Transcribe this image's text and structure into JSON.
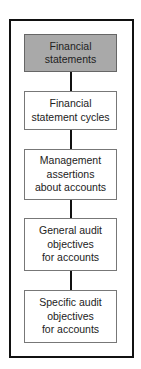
{
  "diagram": {
    "nodes": [
      {
        "label": "Financial statements",
        "lines": [
          "Financial",
          "statements"
        ],
        "highlighted": true
      },
      {
        "label": "Financial statement cycles",
        "lines": [
          "Financial",
          "statement cycles"
        ]
      },
      {
        "label": "Management assertions about accounts",
        "lines": [
          "Management",
          "assertions",
          "about accounts"
        ]
      },
      {
        "label": "General audit objectives for accounts",
        "lines": [
          "General audit",
          "objectives",
          "for accounts"
        ]
      },
      {
        "label": "Specific audit objectives for accounts",
        "lines": [
          "Specific audit",
          "objectives",
          "for accounts"
        ]
      }
    ],
    "colors": {
      "highlight": "#a9a9a9",
      "border": "#111111"
    }
  }
}
